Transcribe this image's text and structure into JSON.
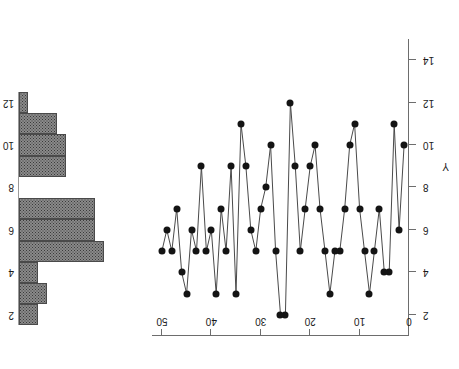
{
  "figure": {
    "orientation_degrees": 180,
    "background_color": "#ffffff",
    "marker_color": "#141414",
    "line_color": "#4a4a4a",
    "axis_color": "#6d6d6d",
    "hist_fill_color": "#8a8a8a",
    "hist_edge_color": "#4a4a4a"
  },
  "run_chart": {
    "x_axis": {
      "position": "top",
      "ticks": [
        0,
        10,
        20,
        30,
        40,
        50
      ],
      "tick_labels": [
        "0",
        "10",
        "20",
        "30",
        "40",
        "50"
      ],
      "min": 0,
      "max": 52,
      "direction": "right-to-left",
      "label": ""
    },
    "y_axis": {
      "position": "right",
      "ticks": [
        2,
        4,
        6,
        8,
        10,
        12,
        14
      ],
      "tick_labels": [
        "2",
        "4",
        "6",
        "8",
        "10",
        "12",
        "14"
      ],
      "min": 1,
      "max": 15,
      "direction": "top-to-bottom",
      "label": "Y"
    }
  },
  "histogram": {
    "y_axis": {
      "ticks": [
        2,
        4,
        6,
        8,
        10,
        12
      ],
      "tick_labels": [
        "2",
        "4",
        "6",
        "8",
        "10",
        "12"
      ]
    },
    "bin_width": 1,
    "max_count": 9
  },
  "chart_data": [
    {
      "type": "line",
      "id": "run-chart",
      "title": "",
      "subtitle": "",
      "xlabel": "",
      "ylabel": "Y",
      "xlim": [
        0,
        52
      ],
      "ylim": [
        1,
        15
      ],
      "grid": false,
      "legend": false,
      "markers": "filled-circle",
      "note": "Sequence / run chart of individual observations; x is observation index counted from the right-hand origin, y axis increases downward in the rotated rendering.",
      "x": [
        1,
        2,
        3,
        4,
        5,
        6,
        7,
        8,
        9,
        10,
        11,
        12,
        13,
        14,
        15,
        16,
        17,
        18,
        19,
        20,
        21,
        22,
        23,
        24,
        25,
        26,
        27,
        28,
        29,
        30,
        31,
        32,
        33,
        34,
        35,
        36,
        37,
        38,
        39,
        40,
        41,
        42,
        43,
        44,
        45,
        46,
        47,
        48,
        49,
        50
      ],
      "values": [
        10,
        6,
        11,
        4,
        4,
        7,
        5,
        3,
        5,
        7,
        11,
        10,
        7,
        5,
        5,
        3,
        5,
        7,
        10,
        9,
        7,
        5,
        9,
        12,
        2,
        2,
        5,
        10,
        8,
        7,
        5,
        6,
        9,
        11,
        3,
        9,
        5,
        7,
        3,
        6,
        5,
        9,
        5,
        6,
        3,
        4,
        7,
        5,
        6,
        5
      ],
      "series": [
        {
          "name": "Y",
          "values": [
            10,
            6,
            11,
            4,
            4,
            7,
            5,
            3,
            5,
            7,
            11,
            10,
            7,
            5,
            5,
            3,
            5,
            7,
            10,
            9,
            7,
            5,
            9,
            12,
            2,
            2,
            5,
            10,
            8,
            7,
            5,
            6,
            9,
            11,
            3,
            9,
            5,
            7,
            3,
            6,
            5,
            9,
            5,
            6,
            3,
            4,
            7,
            5,
            6,
            5
          ]
        }
      ]
    },
    {
      "type": "bar",
      "id": "histogram",
      "orientation": "horizontal",
      "title": "",
      "xlabel": "",
      "ylabel": "",
      "grid": false,
      "legend": false,
      "note": "Marginal frequency histogram of the Y values, bins of width 1 centred on integers; bars grow leftward from the baseline.",
      "categories": [
        "2",
        "3",
        "4",
        "5",
        "6",
        "7",
        "8",
        "9",
        "10",
        "11",
        "12"
      ],
      "values": [
        2,
        3,
        2,
        9,
        8,
        8,
        0,
        5,
        5,
        4,
        1
      ],
      "xlim": [
        0,
        9
      ],
      "ylim": [
        1.5,
        12.5
      ]
    }
  ]
}
